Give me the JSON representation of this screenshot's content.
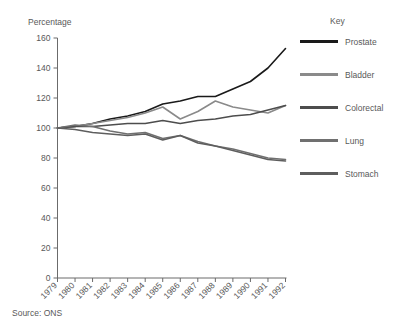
{
  "figure": {
    "ylabel": "Percentage",
    "source_note": "Source: ONS",
    "legend_title": "Key"
  },
  "legend": {
    "items": [
      {
        "label": "Prostate",
        "color": "#1a1a1a"
      },
      {
        "label": "Bladder",
        "color": "#8a8a8a"
      },
      {
        "label": "Colorectal",
        "color": "#4d4d4d"
      },
      {
        "label": "Lung",
        "color": "#707070"
      },
      {
        "label": "Stomach",
        "color": "#5e5e5e"
      }
    ]
  },
  "chart_data": {
    "type": "line",
    "title": "",
    "xlabel": "",
    "ylabel": "Percentage",
    "ylim": [
      0,
      160
    ],
    "yticks": [
      0,
      20,
      40,
      60,
      80,
      100,
      120,
      140,
      160
    ],
    "grid": false,
    "legend_position": "right",
    "legend_title": "Key",
    "source": "Source: ONS",
    "x": [
      1979,
      1980,
      1981,
      1982,
      1983,
      1984,
      1985,
      1986,
      1987,
      1988,
      1989,
      1990,
      1991,
      1992
    ],
    "categories": [
      "1979",
      "1980",
      "1981",
      "1982",
      "1983",
      "1984",
      "1985",
      "1986",
      "1987",
      "1988",
      "1989",
      "1990",
      "1991",
      "1992"
    ],
    "series": [
      {
        "name": "Prostate",
        "color": "#1a1a1a",
        "values": [
          100,
          101,
          103,
          106,
          108,
          111,
          116,
          118,
          121,
          121,
          126,
          131,
          140,
          153
        ]
      },
      {
        "name": "Bladder",
        "color": "#8a8a8a",
        "values": [
          100,
          101,
          103,
          105,
          107,
          110,
          114,
          106,
          111,
          118,
          114,
          112,
          110,
          115
        ]
      },
      {
        "name": "Colorectal",
        "color": "#4d4d4d",
        "values": [
          100,
          101,
          101,
          102,
          103,
          103,
          105,
          103,
          105,
          106,
          108,
          109,
          112,
          115
        ]
      },
      {
        "name": "Lung",
        "color": "#707070",
        "values": [
          100,
          102,
          101,
          98,
          96,
          97,
          93,
          95,
          91,
          88,
          86,
          83,
          80,
          79
        ]
      },
      {
        "name": "Stomach",
        "color": "#5e5e5e",
        "values": [
          100,
          99,
          97,
          96,
          95,
          96,
          92,
          95,
          90,
          88,
          85,
          82,
          79,
          78
        ]
      }
    ]
  }
}
